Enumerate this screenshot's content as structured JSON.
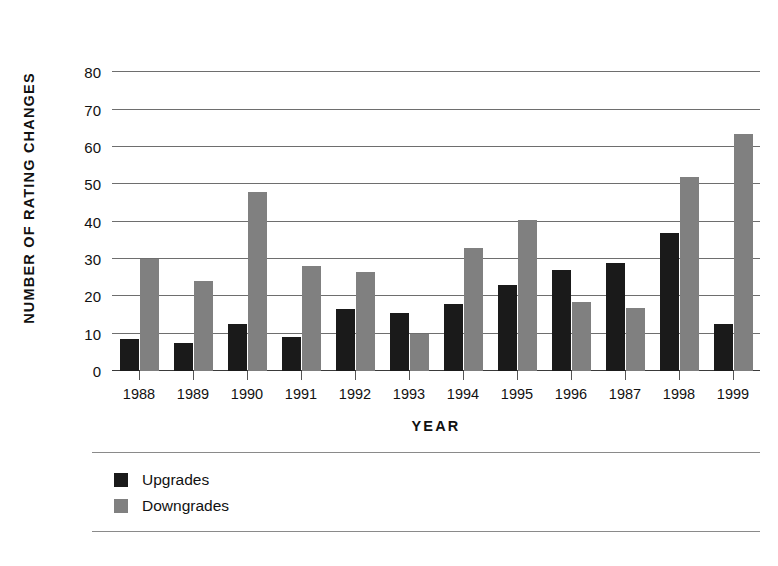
{
  "chart_data": {
    "type": "bar",
    "title": "",
    "xlabel": "YEAR",
    "ylabel": "NUMBER OF RATING CHANGES",
    "ylim": [
      0,
      90
    ],
    "ytick_step": 10,
    "yticks": [
      0,
      10,
      20,
      30,
      40,
      50,
      60,
      70,
      80
    ],
    "ytick_labels": [
      "0",
      "10",
      "20",
      "30",
      "40",
      "50",
      "60",
      "70",
      "80"
    ],
    "grid": true,
    "legend_position": "below-left",
    "categories": [
      "1988",
      "1989",
      "1990",
      "1991",
      "1992",
      "1993",
      "1994",
      "1995",
      "1996",
      "1987",
      "1998",
      "1999"
    ],
    "series": [
      {
        "name": "Upgrades",
        "color": "#1a1a1a",
        "values": [
          8.5,
          7.5,
          12.5,
          9.0,
          16.5,
          15.5,
          18.0,
          23.0,
          27.0,
          29.0,
          37.0,
          12.5
        ]
      },
      {
        "name": "Downgrades",
        "color": "#808080",
        "values": [
          30.0,
          24.0,
          48.0,
          28.0,
          26.5,
          10.0,
          33.0,
          40.5,
          18.5,
          17.0,
          52.0,
          63.5
        ]
      }
    ]
  },
  "legend": {
    "items": [
      {
        "label": "Upgrades",
        "swatch": "upgrades"
      },
      {
        "label": "Downgrades",
        "swatch": "downgrades"
      }
    ]
  },
  "colors": {
    "upgrades": "#1a1a1a",
    "downgrades": "#808080",
    "gridline": "#6e6e6e",
    "axis": "#3a3a3a",
    "text": "#111111",
    "background": "#ffffff"
  }
}
